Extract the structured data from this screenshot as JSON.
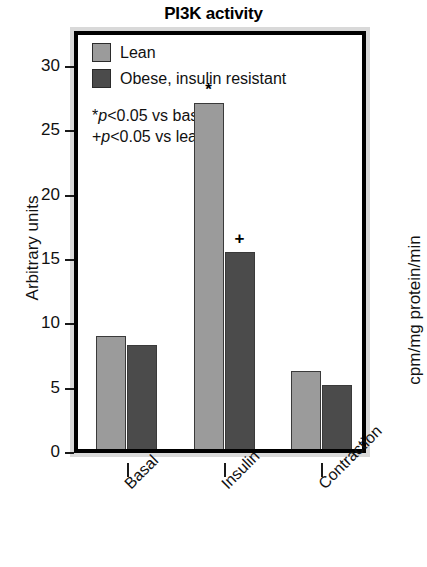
{
  "chart_data": {
    "type": "bar",
    "title": "PI3K activity",
    "xlabel": "",
    "ylabel": "Arbitrary units",
    "ylabel_right": "cpm/mg protein/min",
    "categories": [
      "Basal",
      "Insulin",
      "Contraction"
    ],
    "series": [
      {
        "name": "Lean",
        "color": "#9b9b9b",
        "values": [
          9.1,
          27.2,
          6.4
        ]
      },
      {
        "name": "Obese, insulin resistant",
        "color": "#4b4b4b",
        "values": [
          8.4,
          15.6,
          5.3
        ]
      }
    ],
    "ylim": [
      0,
      32
    ],
    "yticks": [
      0,
      5,
      10,
      15,
      20,
      25,
      30
    ],
    "ytick_labels": [
      "0",
      "5",
      "10",
      "15",
      "20",
      "25",
      "30"
    ],
    "grid": false,
    "legend_position": "top-left",
    "annotations": [
      {
        "text": "*",
        "category": "Insulin",
        "series": "Lean",
        "meaning": "p<0.05 vs basal"
      },
      {
        "text": "+",
        "category": "Insulin",
        "series": "Obese, insulin resistant",
        "meaning": "p<0.05 vs lean"
      }
    ],
    "notes": [
      {
        "marker": "*",
        "italic": "p",
        "rest": "<0.05 vs basal"
      },
      {
        "marker": "+",
        "italic": "p",
        "rest": "<0.05 vs lean"
      }
    ]
  },
  "legend": {
    "items": [
      {
        "label": "Lean",
        "color": "#9b9b9b"
      },
      {
        "label": "Obese, insulin resistant",
        "color": "#4b4b4b"
      }
    ]
  },
  "colors": {
    "lean": "#9b9b9b",
    "obese": "#4b4b4b",
    "frame_bevel": "#d9d9d9",
    "frame_border": "#000000",
    "text": "#111111"
  }
}
